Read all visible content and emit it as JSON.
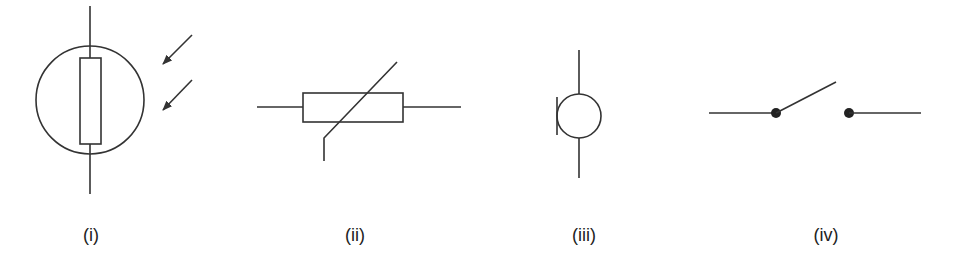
{
  "diagram": {
    "type": "circuit-symbols",
    "colors": {
      "line": "#333333",
      "background": "#ffffff",
      "label": "#222222"
    },
    "symbols": [
      {
        "id": "i",
        "label": "(i)",
        "name": "light-dependent-resistor"
      },
      {
        "id": "ii",
        "label": "(ii)",
        "name": "thermistor"
      },
      {
        "id": "iii",
        "label": "(iii)",
        "name": "microphone"
      },
      {
        "id": "iv",
        "label": "(iv)",
        "name": "open-switch"
      }
    ]
  }
}
